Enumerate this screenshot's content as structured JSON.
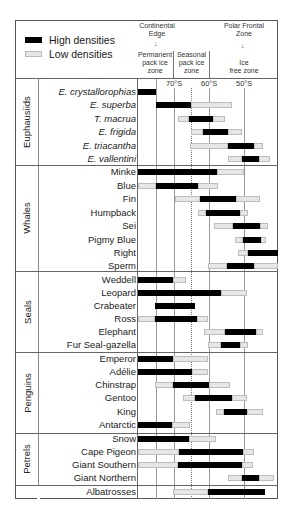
{
  "legend": {
    "high_label": "High densities",
    "low_label": "Low densities",
    "high_color": "#000000",
    "low_color": "#e6e6e6"
  },
  "header": {
    "continental_edge": [
      "Continental",
      "Edge"
    ],
    "polar_frontal_zone": [
      "Polar Frontal",
      "Zone"
    ],
    "zones": [
      {
        "lines": [
          "Permanent",
          "pack ice",
          "zone"
        ]
      },
      {
        "lines": [
          "Seasonal",
          "pack ice",
          "zone"
        ]
      },
      {
        "lines": [
          "Ice",
          "free zone"
        ]
      }
    ],
    "ticks": [
      "70°S",
      "60°S",
      "50°S"
    ]
  },
  "chart_data": {
    "type": "range_bar",
    "title": "",
    "xlabel": "Latitude",
    "x_axis": {
      "ticks": [
        "70°S",
        "60°S",
        "50°S"
      ],
      "range_deg_S": [
        80.3,
        40.3
      ],
      "direction": "south to north"
    },
    "legend": [
      "High densities",
      "Low densities"
    ],
    "annotations": [
      "Continental Edge",
      "Polar Frontal Zone",
      "Permanent pack ice zone",
      "Seasonal pack ice zone",
      "Ice free zone"
    ],
    "groups": [
      {
        "name": "Euphausiids",
        "rows": [
          {
            "label": "E. crystallorophias",
            "italic": true,
            "high": [
              [
                80.0,
                74.9
              ]
            ],
            "low": []
          },
          {
            "label": "E. superba",
            "italic": true,
            "high": [
              [
                74.9,
                65.0
              ]
            ],
            "low": [
              [
                65.0,
                53.3
              ]
            ]
          },
          {
            "label": "T. macrua",
            "italic": true,
            "high": [
              [
                65.4,
                58.6
              ]
            ],
            "low": [
              [
                68.6,
                65.4
              ],
              [
                58.6,
                55.1
              ]
            ]
          },
          {
            "label": "E. frigida",
            "italic": true,
            "high": [
              [
                61.7,
                54.6
              ]
            ],
            "low": [
              [
                65.0,
                61.7
              ],
              [
                54.6,
                50.6
              ]
            ]
          },
          {
            "label": "E. triacantha",
            "italic": true,
            "high": [
              [
                54.6,
                47.1
              ]
            ],
            "low": [
              [
                65.3,
                54.6
              ],
              [
                47.1,
                44.6
              ]
            ]
          },
          {
            "label": "E. vallentini",
            "italic": true,
            "high": [
              [
                50.6,
                45.7
              ]
            ],
            "low": [
              [
                54.6,
                50.6
              ],
              [
                45.7,
                42.6
              ]
            ]
          }
        ]
      },
      {
        "name": "Whales",
        "rows": [
          {
            "label": "Minke",
            "high": [
              [
                80.0,
                57.4
              ]
            ],
            "low": [
              [
                57.4,
                50.0
              ]
            ]
          },
          {
            "label": "Blue",
            "high": [
              [
                74.9,
                62.9
              ]
            ],
            "low": [
              [
                80.0,
                74.9
              ],
              [
                62.9,
                57.1
              ]
            ]
          },
          {
            "label": "Fin",
            "high": [
              [
                62.6,
                52.3
              ]
            ],
            "low": [
              [
                69.7,
                62.6
              ],
              [
                52.3,
                45.4
              ]
            ]
          },
          {
            "label": "Humpback",
            "high": [
              [
                60.6,
                50.9
              ]
            ],
            "low": [
              [
                62.9,
                60.6
              ],
              [
                50.9,
                48.6
              ]
            ]
          },
          {
            "label": "Sei",
            "high": [
              [
                56.0,
                48.3
              ]
            ],
            "low": [
              [
                61.4,
                56.0
              ],
              [
                48.3,
                46.0
              ]
            ]
          },
          {
            "label": "Pigmy Blue",
            "high": [
              [
                52.3,
                47.1
              ]
            ],
            "low": [
              [
                54.6,
                52.3
              ],
              [
                47.1,
                45.7
              ]
            ]
          },
          {
            "label": "Right",
            "high": [
              [
                48.9,
                40.0
              ]
            ],
            "low": [
              [
                51.7,
                48.9
              ]
            ]
          },
          {
            "label": "Sperm",
            "high": [
              [
                56.0,
                48.3
              ]
            ],
            "low": [
              [
                60.3,
                56.0
              ],
              [
                48.3,
                40.3
              ]
            ]
          }
        ]
      },
      {
        "name": "Seals",
        "rows": [
          {
            "label": "Weddell",
            "high": [
              [
                80.0,
                70.3
              ]
            ],
            "low": [
              [
                70.3,
                66.6
              ]
            ]
          },
          {
            "label": "Leopard",
            "high": [
              [
                80.0,
                56.6
              ]
            ],
            "low": [
              [
                56.6,
                49.1
              ]
            ]
          },
          {
            "label": "Crabeater",
            "high": [
              [
                75.1,
                63.7
              ]
            ],
            "low": []
          },
          {
            "label": "Ross",
            "high": [
              [
                75.1,
                63.1
              ]
            ],
            "low": [
              [
                80.0,
                75.1
              ],
              [
                63.1,
                60.0
              ]
            ]
          },
          {
            "label": "Elephant",
            "high": [
              [
                55.1,
                46.3
              ]
            ],
            "low": [
              [
                61.1,
                55.1
              ],
              [
                46.3,
                44.3
              ]
            ]
          },
          {
            "label": "Fur Seal-gazella",
            "high": [
              [
                56.3,
                50.9
              ]
            ],
            "low": [
              [
                60.0,
                56.3
              ],
              [
                50.9,
                48.6
              ]
            ]
          }
        ]
      },
      {
        "name": "Penguins",
        "rows": [
          {
            "label": "Emperor",
            "high": [
              [
                80.0,
                70.3
              ]
            ],
            "low": [
              [
                70.3,
                60.3
              ]
            ]
          },
          {
            "label": "Adélie",
            "high": [
              [
                80.0,
                64.6
              ]
            ],
            "low": [
              [
                64.6,
                60.3
              ]
            ]
          },
          {
            "label": "Chinstrap",
            "high": [
              [
                70.3,
                60.0
              ]
            ],
            "low": [
              [
                75.1,
                70.3
              ],
              [
                60.0,
                54.3
              ]
            ]
          },
          {
            "label": "Gentoo",
            "high": [
              [
                64.0,
                53.4
              ]
            ],
            "low": [
              [
                67.4,
                64.0
              ],
              [
                53.4,
                49.1
              ]
            ]
          },
          {
            "label": "King",
            "high": [
              [
                56.0,
                49.1
              ]
            ],
            "low": [
              [
                58.3,
                56.0
              ],
              [
                49.1,
                44.6
              ]
            ]
          },
          {
            "label": "Antarctic",
            "high": [
              [
                80.0,
                70.6
              ]
            ],
            "low": [
              [
                70.6,
                65.4
              ]
            ]
          }
        ]
      },
      {
        "name": "Petrels",
        "rows": [
          {
            "label": "Snow",
            "high": [
              [
                80.0,
                65.7
              ]
            ],
            "low": [
              [
                65.7,
                58.0
              ]
            ]
          },
          {
            "label": "Cape Pigeon",
            "high": [
              [
                68.6,
                50.3
              ]
            ],
            "low": [
              [
                80.0,
                68.6
              ],
              [
                50.3,
                47.1
              ]
            ]
          },
          {
            "label": "Giant Southern",
            "high": [
              [
                68.9,
                50.6
              ]
            ],
            "low": [
              [
                80.0,
                68.9
              ],
              [
                50.6,
                47.4
              ]
            ]
          },
          {
            "label": "Giant Northern",
            "high": [
              [
                50.6,
                45.7
              ]
            ],
            "low": [
              [
                54.6,
                50.6
              ],
              [
                45.7,
                41.4
              ]
            ]
          }
        ]
      },
      {
        "name": "",
        "rows": [
          {
            "label": "Albatrosses",
            "high": [
              [
                60.3,
                44.0
              ]
            ],
            "low": [
              [
                70.3,
                60.3
              ]
            ]
          }
        ]
      }
    ]
  },
  "layout": {
    "groups": [
      {
        "name": "Euphausiids",
        "top": 79,
        "bottom": 165
      },
      {
        "name": "Whales",
        "top": 165,
        "bottom": 271
      },
      {
        "name": "Seals",
        "top": 271,
        "bottom": 352
      },
      {
        "name": "Penguins",
        "top": 352,
        "bottom": 433
      },
      {
        "name": "Petrels",
        "top": 433,
        "bottom": 485
      },
      {
        "name": "",
        "top": 485,
        "bottom": 499
      }
    ],
    "row_y": [
      92,
      105,
      119,
      132,
      146,
      159,
      172,
      186,
      199,
      213,
      226,
      240,
      253,
      266,
      280,
      293,
      306,
      319,
      332,
      345,
      359,
      372,
      385,
      398,
      412,
      425,
      439,
      452,
      465,
      478,
      492
    ],
    "bars_px": [
      [
        [
          "h",
          138,
          156
        ]
      ],
      [
        [
          "h",
          156,
          191
        ],
        [
          "l",
          191,
          232
        ]
      ],
      [
        [
          "l",
          178,
          189
        ],
        [
          "h",
          189,
          213
        ],
        [
          "l",
          213,
          225
        ]
      ],
      [
        [
          "l",
          191,
          203
        ],
        [
          "h",
          203,
          228
        ],
        [
          "l",
          228,
          242
        ]
      ],
      [
        [
          "l",
          190,
          228
        ],
        [
          "h",
          228,
          254
        ],
        [
          "l",
          254,
          263
        ]
      ],
      [
        [
          "l",
          228,
          242
        ],
        [
          "h",
          242,
          259
        ],
        [
          "l",
          259,
          270
        ]
      ],
      [
        [
          "h",
          138,
          217
        ],
        [
          "l",
          217,
          244
        ]
      ],
      [
        [
          "l",
          138,
          156
        ],
        [
          "h",
          156,
          198
        ],
        [
          "l",
          198,
          218
        ]
      ],
      [
        [
          "l",
          175,
          200
        ],
        [
          "h",
          200,
          236
        ],
        [
          "l",
          236,
          260
        ]
      ],
      [
        [
          "l",
          198,
          206
        ],
        [
          "h",
          206,
          240
        ],
        [
          "l",
          240,
          248
        ]
      ],
      [
        [
          "l",
          214,
          233
        ],
        [
          "h",
          233,
          260
        ],
        [
          "l",
          260,
          268
        ]
      ],
      [
        [
          "l",
          235,
          243
        ],
        [
          "h",
          243,
          261
        ],
        [
          "l",
          261,
          266
        ]
      ],
      [
        [
          "l",
          238,
          248
        ],
        [
          "h",
          248,
          278
        ]
      ],
      [
        [
          "l",
          208,
          227
        ],
        [
          "h",
          227,
          254
        ],
        [
          "l",
          254,
          278
        ]
      ],
      [
        [
          "h",
          138,
          173
        ],
        [
          "l",
          173,
          186
        ]
      ],
      [
        [
          "h",
          138,
          221
        ],
        [
          "l",
          221,
          247
        ]
      ],
      [
        [
          "h",
          155,
          195
        ]
      ],
      [
        [
          "l",
          138,
          155
        ],
        [
          "h",
          155,
          197
        ],
        [
          "l",
          197,
          208
        ]
      ],
      [
        [
          "l",
          204,
          225
        ],
        [
          "h",
          225,
          256
        ],
        [
          "l",
          256,
          263
        ]
      ],
      [
        [
          "l",
          208,
          221
        ],
        [
          "h",
          221,
          240
        ],
        [
          "l",
          240,
          248
        ]
      ],
      [
        [
          "h",
          138,
          173
        ],
        [
          "l",
          173,
          208
        ]
      ],
      [
        [
          "h",
          138,
          192
        ],
        [
          "l",
          192,
          208
        ]
      ],
      [
        [
          "l",
          155,
          173
        ],
        [
          "h",
          173,
          209
        ],
        [
          "l",
          209,
          230
        ]
      ],
      [
        [
          "l",
          183,
          195
        ],
        [
          "h",
          195,
          232
        ],
        [
          "l",
          232,
          247
        ]
      ],
      [
        [
          "l",
          216,
          224
        ],
        [
          "h",
          224,
          247
        ],
        [
          "l",
          247,
          263
        ]
      ],
      [
        [
          "h",
          138,
          172
        ],
        [
          "l",
          172,
          190
        ]
      ],
      [
        [
          "h",
          138,
          189
        ],
        [
          "l",
          189,
          216
        ]
      ],
      [
        [
          "l",
          138,
          179
        ],
        [
          "h",
          179,
          243
        ],
        [
          "l",
          243,
          254
        ]
      ],
      [
        [
          "l",
          138,
          178
        ],
        [
          "h",
          178,
          242
        ],
        [
          "l",
          242,
          253
        ]
      ],
      [
        [
          "l",
          228,
          242
        ],
        [
          "h",
          242,
          259
        ],
        [
          "l",
          259,
          274
        ]
      ],
      [
        [
          "l",
          173,
          208
        ],
        [
          "h",
          208,
          265
        ]
      ]
    ]
  }
}
